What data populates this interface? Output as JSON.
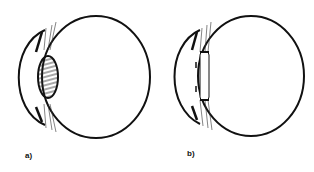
{
  "figure": {
    "panels": [
      {
        "id": "a",
        "label": "a)",
        "lens_state": "thick-rounded-hatched"
      },
      {
        "id": "b",
        "label": "b)",
        "lens_state": "thin-flattened"
      }
    ]
  }
}
